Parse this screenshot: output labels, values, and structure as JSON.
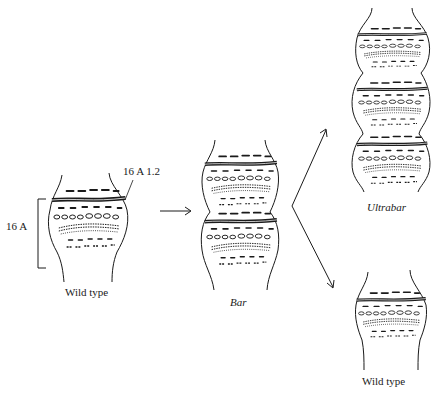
{
  "diagram": {
    "labels": {
      "bracket_label": "16 A",
      "band_label": "16 A 1.2",
      "wild_type_left": "Wild type",
      "bar": "Bar",
      "ultrabar": "Ultrabar",
      "wild_type_right": "Wild type"
    },
    "nodes": [
      {
        "id": "wild-type-left",
        "label": "Wild type",
        "segments": 1
      },
      {
        "id": "bar",
        "label": "Bar",
        "segments": 2
      },
      {
        "id": "ultrabar",
        "label": "Ultrabar",
        "segments": 3
      },
      {
        "id": "wild-type-right",
        "label": "Wild type",
        "segments": 1
      }
    ],
    "edges": [
      {
        "from": "wild-type-left",
        "to": "bar"
      },
      {
        "from": "bar",
        "to": "ultrabar"
      },
      {
        "from": "bar",
        "to": "wild-type-right"
      }
    ],
    "colors": {
      "ink": "#1a1a1a",
      "background": "#ffffff"
    }
  }
}
